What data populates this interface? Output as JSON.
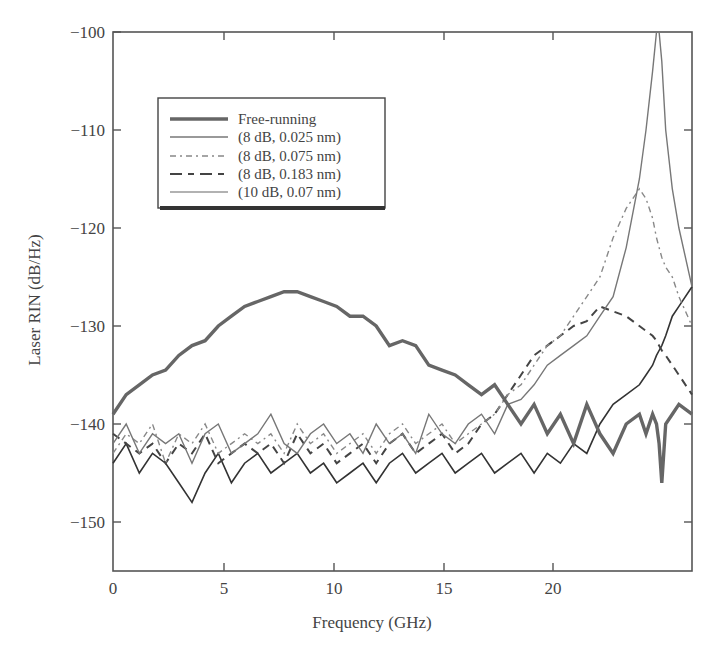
{
  "chart_data": {
    "type": "line",
    "title": "",
    "xlabel": "Frequency (GHz)",
    "ylabel": "Laser RIN (dB/Hz)",
    "xlim": [
      0,
      22
    ],
    "ylim": [
      -155,
      -100
    ],
    "x_ticks": [
      0,
      5,
      10,
      15,
      20
    ],
    "x_tick_labels": [
      "0",
      "5",
      "10",
      "15",
      "20"
    ],
    "y_ticks": [
      -100,
      -110,
      -120,
      -130,
      -140,
      -150
    ],
    "y_tick_labels": [
      "−100",
      "−110",
      "−120",
      "−130",
      "−140",
      "−150"
    ],
    "grid": false,
    "legend_position": "upper-left (inset box)",
    "x": [
      0,
      0.5,
      1,
      1.5,
      2,
      2.5,
      3,
      3.5,
      4,
      4.5,
      5,
      5.5,
      6,
      6.5,
      7,
      7.5,
      8,
      8.5,
      9,
      9.5,
      10,
      10.5,
      11,
      11.5,
      12,
      12.5,
      13,
      13.5,
      14,
      14.5,
      15,
      15.5,
      16,
      16.5,
      17,
      17.5,
      18,
      18.5,
      19,
      19.5,
      20,
      20.25,
      20.5,
      20.65,
      20.75,
      20.85,
      21,
      21.25,
      21.5,
      22
    ],
    "series": [
      {
        "name": "Free-running",
        "style": "thick-solid",
        "color": "#666666",
        "values": [
          -139,
          -137,
          -136,
          -135,
          -134.5,
          -133,
          -132,
          -131.5,
          -130,
          -129,
          -128,
          -127.5,
          -127,
          -126.5,
          -126.5,
          -127,
          -127.5,
          -128,
          -129,
          -129,
          -130,
          -132,
          -131.5,
          -132,
          -134,
          -134.5,
          -135,
          -136,
          -137,
          -136,
          -138,
          -140,
          -138,
          -141,
          -139,
          -142,
          -138,
          -141,
          -143,
          -140,
          -139,
          -141,
          -139,
          -140,
          -142,
          -146,
          -140,
          -139,
          -138,
          -139
        ]
      },
      {
        "name": "(8 dB, 0.025 nm)",
        "style": "thin-solid",
        "color": "#777777",
        "values": [
          -142,
          -140,
          -143,
          -141,
          -142,
          -141,
          -144,
          -141,
          -140,
          -143,
          -142,
          -141,
          -139,
          -142,
          -143,
          -141,
          -140,
          -142,
          -141,
          -143,
          -140,
          -142,
          -141,
          -143,
          -139,
          -141,
          -142,
          -140,
          -139,
          -141,
          -138,
          -137.5,
          -136,
          -134,
          -133,
          -132,
          -131,
          -129,
          -127,
          -122,
          -115,
          -110,
          -104,
          -100,
          -100,
          -103,
          -110,
          -116,
          -120,
          -126
        ]
      },
      {
        "name": "(8 dB, 0.075 nm)",
        "style": "dash-dot",
        "color": "#888888",
        "values": [
          -143,
          -141,
          -142,
          -140,
          -144,
          -141,
          -142,
          -140,
          -143,
          -142,
          -141,
          -142,
          -141,
          -143,
          -140,
          -142,
          -141,
          -143,
          -142,
          -141,
          -143,
          -141,
          -140,
          -142,
          -141,
          -140,
          -142,
          -141,
          -140,
          -139,
          -137,
          -136,
          -134,
          -132,
          -131,
          -129,
          -127,
          -125,
          -121,
          -118,
          -116,
          -117,
          -119,
          -121,
          -122,
          -123,
          -124,
          -125,
          -127,
          -130
        ]
      },
      {
        "name": "(8 dB, 0.183 nm)",
        "style": "dashed",
        "color": "#444444",
        "values": [
          -141,
          -142,
          -143,
          -142,
          -144,
          -142,
          -143,
          -141,
          -144,
          -143,
          -142,
          -143,
          -142,
          -144,
          -141,
          -143,
          -142,
          -144,
          -143,
          -142,
          -144,
          -142,
          -141,
          -143,
          -142,
          -141,
          -143,
          -142,
          -140,
          -139,
          -137,
          -135,
          -133,
          -132,
          -131,
          -130,
          -129.5,
          -128,
          -128.5,
          -129,
          -130,
          -130.5,
          -131,
          -131.5,
          -132,
          -132.5,
          -133,
          -134,
          -135,
          -137
        ]
      },
      {
        "name": "(10 dB, 0.07 nm)",
        "style": "thin-solid-dark",
        "color": "#333333",
        "values": [
          -144,
          -142,
          -145,
          -143,
          -144,
          -146,
          -148,
          -145,
          -143,
          -146,
          -144,
          -143,
          -145,
          -144,
          -143,
          -145,
          -144,
          -146,
          -145,
          -144,
          -146,
          -144,
          -143,
          -145,
          -144,
          -143,
          -145,
          -144,
          -143,
          -145,
          -144,
          -143,
          -145,
          -143,
          -144,
          -142,
          -143,
          -140,
          -138,
          -137,
          -136,
          -135,
          -134,
          -133,
          -132.5,
          -132,
          -131,
          -129,
          -128,
          -126
        ]
      }
    ]
  },
  "legend": {
    "items": [
      {
        "label": "Free-running"
      },
      {
        "label": "(8 dB, 0.025 nm)"
      },
      {
        "label": "(8 dB, 0.075 nm)"
      },
      {
        "label": "(8 dB, 0.183 nm)"
      },
      {
        "label": "(10 dB, 0.07 nm)"
      }
    ]
  },
  "axes": {
    "x_title": "Frequency (GHz)",
    "y_title": "Laser RIN (dB/Hz)",
    "x_tick_labels": [
      "0",
      "5",
      "10",
      "15",
      "20"
    ],
    "y_tick_labels": [
      "−100",
      "−110",
      "−120",
      "−130",
      "−140",
      "−150"
    ]
  }
}
